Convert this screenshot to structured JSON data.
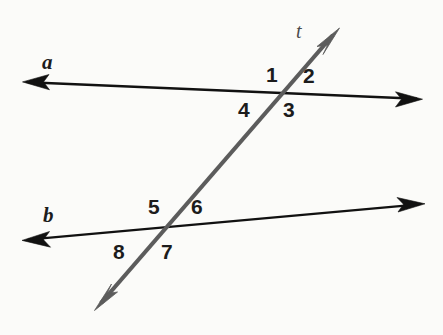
{
  "figure": {
    "kind": "geometry-diagram",
    "background_color": "#fbfbf9",
    "width": 443,
    "height": 335
  },
  "colors": {
    "parallel_line": "#111111",
    "transversal_line": "#5c5c5c",
    "label_text": "#1c1c1c",
    "transversal_label_text": "#4a4a4a"
  },
  "lines": [
    {
      "id": "line-a",
      "label": "a",
      "style": "double-headed-arrow",
      "color": "#111111",
      "stroke_width": 2.4,
      "x1": 24,
      "y1": 82,
      "x2": 421,
      "y2": 99
    },
    {
      "id": "line-b",
      "label": "b",
      "style": "double-headed-arrow",
      "color": "#111111",
      "stroke_width": 2.4,
      "x1": 24,
      "y1": 240,
      "x2": 423,
      "y2": 204
    },
    {
      "id": "transversal-t",
      "label": "t",
      "style": "double-headed-arrow",
      "color": "#5c5c5c",
      "stroke_width": 4.2,
      "x1": 96,
      "y1": 309,
      "x2": 339,
      "y2": 29
    }
  ],
  "intersections": [
    {
      "id": "intersection-upper",
      "lines": [
        "line-a",
        "transversal-t"
      ],
      "x": 280,
      "y": 93
    },
    {
      "id": "intersection-lower",
      "lines": [
        "line-b",
        "transversal-t"
      ],
      "x": 163,
      "y": 229
    }
  ],
  "line_labels": [
    {
      "id": "label-a",
      "text": "a",
      "x": 42,
      "y": 52,
      "for": "line-a"
    },
    {
      "id": "label-b",
      "text": "b",
      "x": 43,
      "y": 205,
      "for": "line-b"
    },
    {
      "id": "label-t",
      "text": "t",
      "x": 296,
      "y": 21,
      "for": "transversal-t"
    }
  ],
  "angle_labels": [
    {
      "id": "angle-1",
      "text": "1",
      "x": 266,
      "y": 64,
      "position": "upper-left-of-upper-intersection"
    },
    {
      "id": "angle-2",
      "text": "2",
      "x": 303,
      "y": 65,
      "position": "upper-right-of-upper-intersection"
    },
    {
      "id": "angle-3",
      "text": "3",
      "x": 283,
      "y": 99,
      "position": "lower-right-of-upper-intersection"
    },
    {
      "id": "angle-4",
      "text": "4",
      "x": 238,
      "y": 99,
      "position": "lower-left-of-upper-intersection"
    },
    {
      "id": "angle-5",
      "text": "5",
      "x": 148,
      "y": 196,
      "position": "upper-left-of-lower-intersection"
    },
    {
      "id": "angle-6",
      "text": "6",
      "x": 191,
      "y": 196,
      "position": "upper-right-of-lower-intersection"
    },
    {
      "id": "angle-7",
      "text": "7",
      "x": 161,
      "y": 241,
      "position": "lower-right-of-lower-intersection"
    },
    {
      "id": "angle-8",
      "text": "8",
      "x": 113,
      "y": 241,
      "position": "lower-left-of-lower-intersection"
    }
  ]
}
